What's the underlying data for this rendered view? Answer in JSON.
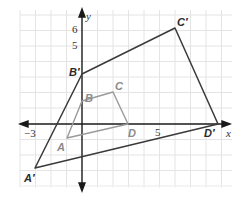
{
  "colors": {
    "grid": "#e2e2e2",
    "axis": "#1a1a1a",
    "image_polygon": "#3a3a3a",
    "preimage_polygon": "#9a9a9a",
    "image_label": "#2a2a2a",
    "preimage_label": "#8a8a8a"
  },
  "axes": {
    "x_label": "x",
    "y_label": "y",
    "x_ticks": [
      {
        "value": -3,
        "label": "−3"
      },
      {
        "value": 5,
        "label": "5"
      }
    ],
    "y_ticks": [
      {
        "value": 5,
        "label": "5"
      },
      {
        "value": 6,
        "label": "6"
      }
    ]
  },
  "preimage": {
    "name": "ABCD",
    "vertices": [
      {
        "label": "A",
        "x": -1,
        "y": -1
      },
      {
        "label": "B",
        "x": 0,
        "y": 1.5
      },
      {
        "label": "C",
        "x": 2,
        "y": 2
      },
      {
        "label": "D",
        "x": 3,
        "y": 0
      }
    ]
  },
  "image": {
    "name": "A'B'C'D'",
    "vertices": [
      {
        "label": "A′",
        "x": -3,
        "y": -3
      },
      {
        "label": "B′",
        "x": 0,
        "y": 3
      },
      {
        "label": "C′",
        "x": 6,
        "y": 6
      },
      {
        "label": "D′",
        "x": 9,
        "y": 0
      }
    ]
  }
}
